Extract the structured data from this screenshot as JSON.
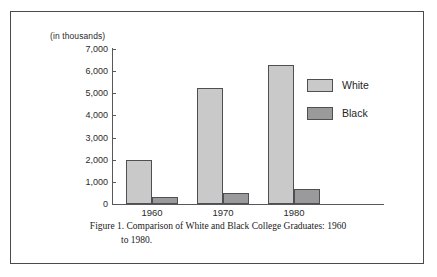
{
  "figure": {
    "caption_line_1": "Figure 1. Comparison of White and Black College Graduates: 1960",
    "caption_line_2": "to 1980."
  },
  "colors": {
    "white_series": "#c9c9c9",
    "black_series": "#9a9a9a",
    "axis": "#58585c",
    "border": "#4a4a4f",
    "background": "#ffffff"
  },
  "legend": {
    "position": "right",
    "entries": [
      {
        "label": "White",
        "swatch": "white-swatch"
      },
      {
        "label": "Black",
        "swatch": "black-swatch"
      }
    ]
  },
  "chart_data": {
    "type": "bar",
    "title": "Figure 1. Comparison of White and Black College Graduates: 1960 to 1980.",
    "xlabel": "",
    "ylabel": "(in thousands)",
    "categories": [
      "1960",
      "1970",
      "1980"
    ],
    "series": [
      {
        "name": "White",
        "values": [
          2000,
          5250,
          6300
        ]
      },
      {
        "name": "Black",
        "values": [
          300,
          480,
          670
        ]
      }
    ],
    "ylim": [
      0,
      7000
    ],
    "yticks": [
      0,
      1000,
      2000,
      3000,
      4000,
      5000,
      6000,
      7000
    ],
    "ytick_labels": [
      "0",
      "1,000",
      "2,000",
      "3,000",
      "4,000",
      "5,000",
      "6,000",
      "7,000"
    ],
    "grid": false,
    "legend_entries": [
      "White",
      "Black"
    ]
  }
}
